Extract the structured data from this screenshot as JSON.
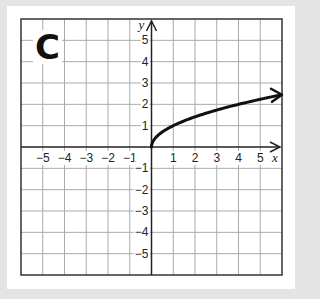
{
  "panel": {
    "label": "C"
  },
  "colors": {
    "background": "#e4e4e4",
    "card": "#ffffff",
    "grid": "#aaaaaa",
    "axis": "#222222",
    "curve": "#111111"
  },
  "chart_data": {
    "type": "line",
    "title": "C",
    "xlabel": "x",
    "ylabel": "y",
    "xlim": [
      -6,
      6
    ],
    "ylim": [
      -6,
      6
    ],
    "grid": true,
    "x_ticks": [
      -5,
      -4,
      -3,
      -2,
      -1,
      1,
      2,
      3,
      4,
      5
    ],
    "y_ticks": [
      -5,
      -4,
      -3,
      -2,
      -1,
      1,
      2,
      3,
      4,
      5
    ],
    "x_tick_labels": [
      "−5",
      "−4",
      "−3",
      "−2",
      "−1",
      "1",
      "2",
      "3",
      "4",
      "5"
    ],
    "y_tick_labels": [
      "−5",
      "−4",
      "−3",
      "−2",
      "−1",
      "1",
      "2",
      "3",
      "4",
      "5"
    ],
    "series": [
      {
        "name": "y = √x",
        "x": [
          0,
          0.25,
          0.5,
          1,
          1.5,
          2,
          3,
          4,
          5,
          6
        ],
        "values": [
          0,
          0.5,
          0.71,
          1,
          1.22,
          1.41,
          1.73,
          2,
          2.24,
          2.45
        ],
        "end_arrow": true,
        "start_point": [
          0,
          0
        ]
      }
    ]
  },
  "axes": {
    "x_name": "x",
    "y_name": "y"
  }
}
